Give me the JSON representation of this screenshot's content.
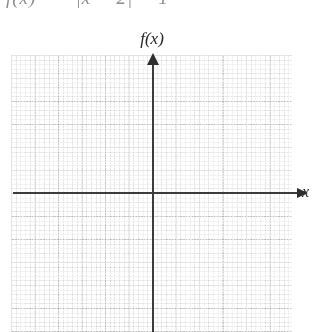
{
  "figure": {
    "type": "cartesian-grid-plot",
    "formula_partial": "f(x) = −|x − 2| − 1",
    "y_axis_label": "f(x)",
    "x_axis_label": "x",
    "axis_color": "#3c3c3c",
    "grid_color": "#aaaaaa",
    "background_color": "#ffffff"
  },
  "chart_data": {
    "type": "line",
    "title": "",
    "xlabel": "x",
    "ylabel": "f(x)",
    "series": [],
    "x": [],
    "values": [],
    "grid": true,
    "legend": "none",
    "origin_px": {
      "x": 153,
      "y": 193
    },
    "major_grid_spacing_px": {
      "x": 23.5,
      "y": 23.0
    },
    "minor_grid_spacing_px": {
      "x": 4.7,
      "y": 4.6
    },
    "plot_area_px": {
      "left": 11,
      "top": 55,
      "width": 281,
      "height": 277
    },
    "note": "Empty coordinate grid provided for the student to graph the function."
  }
}
